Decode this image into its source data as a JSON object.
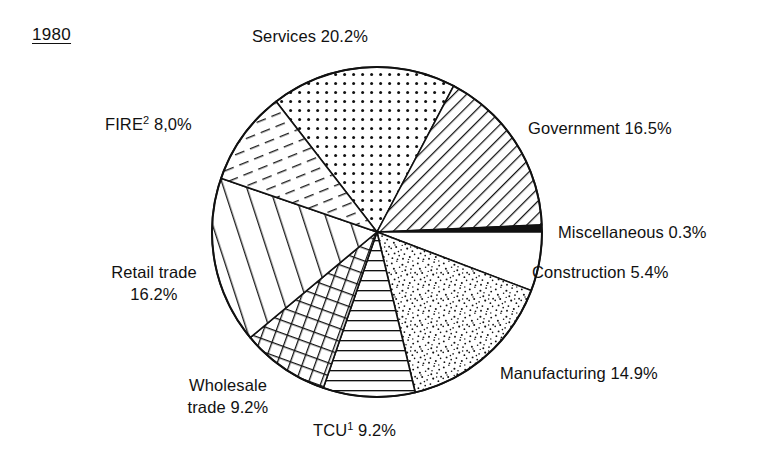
{
  "figure": {
    "year_label": "1980",
    "background_color": "#ffffff",
    "stroke_color": "#111111"
  },
  "chart_data": {
    "type": "pie",
    "title": "1980",
    "xlabel": "",
    "ylabel": "",
    "value_unit": "percent",
    "start_angle_deg": 322.3,
    "direction": "clockwise",
    "center": {
      "x": 377,
      "y": 232
    },
    "radius": 165,
    "categories": [
      "Services",
      "Government",
      "Miscellaneous",
      "Construction",
      "Manufacturing",
      "TCU",
      "Wholesale trade",
      "Retail trade",
      "FIRE"
    ],
    "values": [
      20.2,
      16.5,
      0.3,
      5.4,
      14.9,
      9.2,
      9.2,
      16.2,
      8.0
    ],
    "slices": [
      {
        "name": "Services",
        "label": "Services  20.2%",
        "value": 20.2,
        "value_text": "20.2%",
        "pattern": "dots",
        "start_deg": 322.3,
        "end_deg": 27.7
      },
      {
        "name": "Government",
        "label": "Government 16.5%",
        "value": 16.5,
        "value_text": "16.5%",
        "pattern": "diagonal-lines-up",
        "start_deg": 27.7,
        "end_deg": 87.5
      },
      {
        "name": "Miscellaneous",
        "label": "Miscellaneous  0.3%",
        "value": 0.3,
        "value_text": "0.3%",
        "pattern": "solid-black",
        "start_deg": 87.5,
        "end_deg": 90.0
      },
      {
        "name": "Construction",
        "label": "Construction 5.4%",
        "value": 5.4,
        "value_text": "5.4%",
        "pattern": "blank-white",
        "start_deg": 90.0,
        "end_deg": 110.8
      },
      {
        "name": "Manufacturing",
        "label": "Manufacturing 14.9%",
        "value": 14.9,
        "value_text": "14.9%",
        "pattern": "stipple",
        "start_deg": 110.8,
        "end_deg": 166.6
      },
      {
        "name": "TCU",
        "label_main": "TCU",
        "label_sup": "1",
        "label_tail": " 9.2%",
        "value": 9.2,
        "value_text": "9.2%",
        "pattern": "horizontal-lines",
        "start_deg": 166.6,
        "end_deg": 199.0
      },
      {
        "name": "Wholesale trade",
        "label_line1": "Wholesale",
        "label_line2": "trade 9.2%",
        "value": 9.2,
        "value_text": "9.2%",
        "pattern": "crosshatch",
        "start_deg": 199.0,
        "end_deg": 230.2
      },
      {
        "name": "Retail trade",
        "label_line1": "Retail trade",
        "label_line2": "16.2%",
        "value": 16.2,
        "value_text": "16.2%",
        "pattern": "vertical-lines",
        "start_deg": 230.2,
        "end_deg": 289.0
      },
      {
        "name": "FIRE",
        "label_main": "FIRE",
        "label_sup": "2",
        "label_tail": " 8,0%",
        "value": 8.0,
        "value_text": "8,0%",
        "pattern": "diagonal-dashes",
        "start_deg": 289.0,
        "end_deg": 322.3
      }
    ],
    "legend_position": "callout-labels-around-pie",
    "grid": false
  }
}
